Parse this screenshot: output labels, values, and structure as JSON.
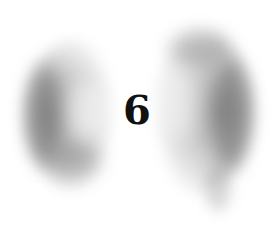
{
  "numeral": {
    "text": "6",
    "color": "#111111"
  },
  "decoration": {
    "style": "charcoal-smudge-crescents",
    "left_crescent": "smudge-left",
    "right_crescent": "smudge-right",
    "smudge_color": "#5a5a5a",
    "background": "#ffffff"
  }
}
